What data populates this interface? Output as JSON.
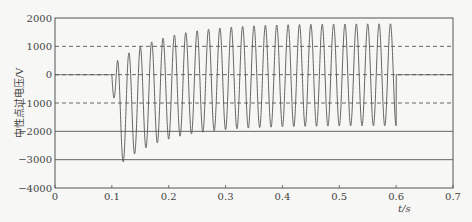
{
  "chart_data": {
    "type": "line",
    "title": "",
    "xlabel": "t/s",
    "ylabel": "中性点过电压/V",
    "xlim": [
      0,
      0.7
    ],
    "ylim": [
      -4000,
      2000
    ],
    "x_ticks": [
      0,
      0.1,
      0.2,
      0.3,
      0.4,
      0.5,
      0.6,
      0.7
    ],
    "x_tick_labels": [
      "0",
      "0.1",
      "0.2",
      "0.3",
      "0.4",
      "0.5",
      "0.6",
      "0.7"
    ],
    "y_ticks": [
      -4000,
      -3000,
      -2000,
      -1000,
      0,
      1000,
      2000
    ],
    "y_tick_labels": [
      "−4000",
      "−3000",
      "−2000",
      "−1000",
      "0",
      "1000",
      "2000"
    ],
    "grid": {
      "solid_lines_y": [
        -3000,
        -2000
      ],
      "dashed_lines_y": [
        -1000,
        0,
        1000
      ]
    },
    "legend": null,
    "series": [
      {
        "name": "中性点过电压",
        "color": "#555555",
        "description": "0 V until fault at t=0.1 s; 50 Hz oscillation with decaying negative DC offset; first trough ≈ -3400 V, first peak ≈ 400 V; steady-state ≈ ±1800 V; returns to ≈ 0 V at t=0.6 s",
        "fault_start_s": 0.1,
        "fault_end_s": 0.6,
        "frequency_hz": 50,
        "steady_amplitude_v": 1800,
        "initial_dc_offset_v": -1550,
        "dc_time_constant_s": 0.083,
        "key_points": [
          {
            "t": 0.0,
            "v": 0
          },
          {
            "t": 0.1,
            "v": 0
          },
          {
            "t": 0.11,
            "v": -3400
          },
          {
            "t": 0.12,
            "v": 400
          },
          {
            "t": 0.13,
            "v": -3000
          },
          {
            "t": 0.14,
            "v": 700
          },
          {
            "t": 0.2,
            "v": 1350
          },
          {
            "t": 0.21,
            "v": -2250
          },
          {
            "t": 0.3,
            "v": 1650
          },
          {
            "t": 0.31,
            "v": -1950
          },
          {
            "t": 0.4,
            "v": 1750
          },
          {
            "t": 0.5,
            "v": 1800
          },
          {
            "t": 0.59,
            "v": -1800
          },
          {
            "t": 0.6,
            "v": 1800
          },
          {
            "t": 0.605,
            "v": 0
          },
          {
            "t": 0.7,
            "v": 0
          }
        ]
      }
    ]
  },
  "plot_area": {
    "left": 55,
    "top": 18,
    "right": 453,
    "bottom": 188
  }
}
